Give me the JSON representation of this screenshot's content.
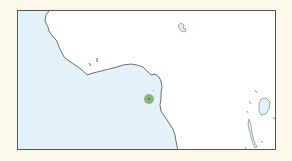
{
  "map": {
    "region": "West and Central Africa coastline (Gulf of Guinea)",
    "colors": {
      "page_background": "#fbf8e9",
      "ocean": "#e2f2f8",
      "land": "#ffffff",
      "coastline": "#333333",
      "frame": "#555555",
      "marker_fill": "#7fa86a",
      "marker_core": "#4d6e3c"
    },
    "marker": {
      "type": "location-dot",
      "x": 148,
      "y": 98,
      "radius": 5
    }
  }
}
